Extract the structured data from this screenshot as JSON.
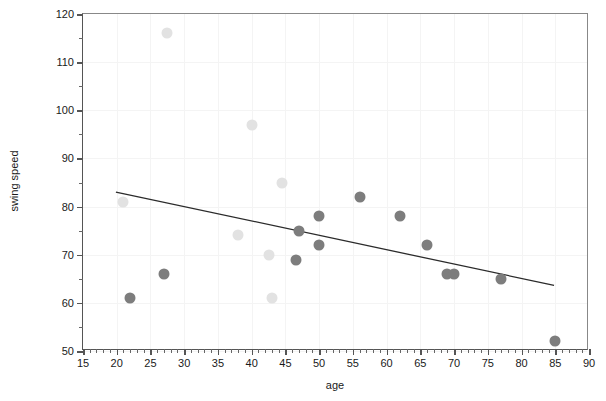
{
  "chart_data": {
    "type": "scatter",
    "title": "",
    "xlabel": "age",
    "ylabel": "swing speed",
    "xlim": [
      15,
      90
    ],
    "ylim": [
      50,
      120
    ],
    "xticks": [
      15,
      20,
      25,
      30,
      35,
      40,
      45,
      50,
      55,
      60,
      65,
      70,
      75,
      80,
      85,
      90
    ],
    "yticks": [
      50,
      60,
      70,
      80,
      90,
      100,
      110,
      120
    ],
    "xtick_labels": [
      "15",
      "20",
      "25",
      "30",
      "35",
      "40",
      "45",
      "50",
      "55",
      "60",
      "65",
      "70",
      "75",
      "80",
      "85",
      "90"
    ],
    "ytick_labels": [
      "50",
      "60",
      "70",
      "80",
      "90",
      "100",
      "110",
      "120"
    ],
    "x_minor_step": 1,
    "y_minor_step": 5,
    "grid": true,
    "legend": "none",
    "series": [
      {
        "name": "light-group",
        "color": "#e2e2e2",
        "marker": "circle",
        "points": [
          {
            "x": 21.0,
            "y": 81
          },
          {
            "x": 27.5,
            "y": 116
          },
          {
            "x": 38.0,
            "y": 74
          },
          {
            "x": 40.0,
            "y": 97
          },
          {
            "x": 42.5,
            "y": 70
          },
          {
            "x": 43.0,
            "y": 61
          },
          {
            "x": 44.5,
            "y": 85
          }
        ]
      },
      {
        "name": "dark-group",
        "color": "#7d7d7d",
        "marker": "circle",
        "points": [
          {
            "x": 22.0,
            "y": 61
          },
          {
            "x": 27.0,
            "y": 66
          },
          {
            "x": 46.5,
            "y": 69
          },
          {
            "x": 47.0,
            "y": 75
          },
          {
            "x": 50.0,
            "y": 72
          },
          {
            "x": 50.0,
            "y": 78
          },
          {
            "x": 56.0,
            "y": 82
          },
          {
            "x": 62.0,
            "y": 78
          },
          {
            "x": 66.0,
            "y": 72
          },
          {
            "x": 69.0,
            "y": 66
          },
          {
            "x": 70.0,
            "y": 66
          },
          {
            "x": 77.0,
            "y": 65
          },
          {
            "x": 85.0,
            "y": 52
          }
        ]
      }
    ],
    "trendline": {
      "name": "linear-fit",
      "color": "#2b2b2b",
      "x_start": 19.9,
      "y_start": 82.8,
      "x_end": 85.1,
      "y_end": 63.3
    }
  }
}
